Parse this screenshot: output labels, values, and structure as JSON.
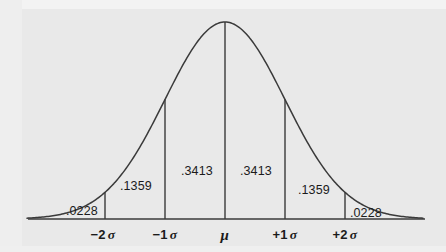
{
  "figure": {
    "kind": "normal-distribution-curve",
    "background_color": "#e9e9e9",
    "curve_color": "#3a3a3a",
    "text_color": "#1b1b1b"
  },
  "axis": {
    "baseline_y": 219,
    "ticks": [
      {
        "name": "minus-2-sigma",
        "sign": "−2",
        "symbol": "σ",
        "x": 103
      },
      {
        "name": "minus-1-sigma",
        "sign": "−1",
        "symbol": "σ",
        "x": 165
      },
      {
        "name": "mu",
        "sign": "",
        "symbol": "μ",
        "x": 225
      },
      {
        "name": "plus-1-sigma",
        "sign": "+1",
        "symbol": "σ",
        "x": 285
      },
      {
        "name": "plus-2-sigma",
        "sign": "+2",
        "symbol": "σ",
        "x": 345
      }
    ]
  },
  "area_labels": [
    {
      "name": "area-left-tail",
      "value": ".0228",
      "x": 66,
      "y": 205
    },
    {
      "name": "area-left-outer",
      "value": ".1359",
      "x": 120,
      "y": 180
    },
    {
      "name": "area-left-inner",
      "value": ".3413",
      "x": 181,
      "y": 165
    },
    {
      "name": "area-right-inner",
      "value": ".3413",
      "x": 240,
      "y": 165
    },
    {
      "name": "area-right-outer",
      "value": ".1359",
      "x": 298,
      "y": 184
    },
    {
      "name": "area-right-tail",
      "value": ".0228",
      "x": 350,
      "y": 207
    }
  ],
  "chart_data": {
    "type": "area",
    "title": "",
    "subtitle": "",
    "xlabel": "",
    "ylabel": "",
    "grid": false,
    "legend": "none",
    "distribution": "standard normal (Gaussian)",
    "x_tick_labels": [
      "−2 σ",
      "−1 σ",
      "μ",
      "+1 σ",
      "+2 σ"
    ],
    "x_tick_values": [
      -2,
      -1,
      0,
      1,
      2
    ],
    "xlim": [
      -3.3,
      3.3
    ],
    "ylim": [
      0,
      1
    ],
    "region_boundaries": [
      -2,
      -1,
      0,
      1,
      2
    ],
    "regions": [
      {
        "label": ".0228",
        "value": 0.0228,
        "from": "-inf",
        "to": -2
      },
      {
        "label": ".1359",
        "value": 0.1359,
        "from": -2,
        "to": -1
      },
      {
        "label": ".3413",
        "value": 0.3413,
        "from": -1,
        "to": 0
      },
      {
        "label": ".3413",
        "value": 0.3413,
        "from": 0,
        "to": 1
      },
      {
        "label": ".1359",
        "value": 0.1359,
        "from": 1,
        "to": 2
      },
      {
        "label": ".0228",
        "value": 0.0228,
        "from": 2,
        "to": "+inf"
      }
    ],
    "vertical_rule_x_values": [
      -2,
      -1,
      0,
      1,
      2
    ],
    "series": [
      {
        "name": "normal-density",
        "x": [
          -3.3,
          -3.0,
          -2.75,
          -2.5,
          -2.25,
          -2.0,
          -1.75,
          -1.5,
          -1.25,
          -1.0,
          -0.75,
          -0.5,
          -0.25,
          0,
          0.25,
          0.5,
          0.75,
          1.0,
          1.25,
          1.5,
          1.75,
          2.0,
          2.25,
          2.5,
          2.75,
          3.0,
          3.3
        ],
        "values": [
          0.004,
          0.011,
          0.023,
          0.044,
          0.079,
          0.135,
          0.216,
          0.325,
          0.458,
          0.607,
          0.755,
          0.882,
          0.969,
          1.0,
          0.969,
          0.882,
          0.755,
          0.607,
          0.458,
          0.325,
          0.216,
          0.135,
          0.079,
          0.044,
          0.023,
          0.011,
          0.004
        ]
      }
    ]
  }
}
